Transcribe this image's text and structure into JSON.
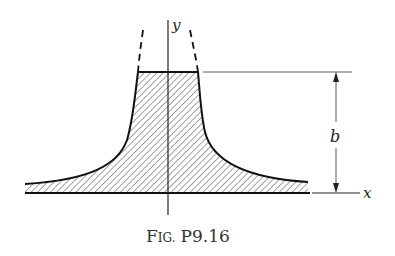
{
  "figure": {
    "caption": "Fig. P9.16",
    "caption_prefix": "F",
    "caption_smallcaps": "IG.",
    "caption_number": "P9.16"
  },
  "axes": {
    "x_label": "x",
    "y_label": "y"
  },
  "dimension": {
    "label": "b"
  },
  "colors": {
    "ink": "#1a1a1a",
    "background": "#ffffff"
  }
}
